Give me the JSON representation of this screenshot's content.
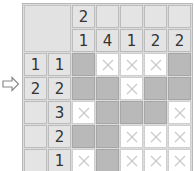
{
  "puzzle": {
    "type": "nonogram",
    "size": {
      "rows": 5,
      "cols": 5
    },
    "column_clues": [
      [
        "2",
        "1"
      ],
      [
        "4"
      ],
      [
        "1"
      ],
      [
        "2"
      ],
      [
        "2"
      ]
    ],
    "column_clue_rows": [
      [
        "2",
        "",
        "",
        "",
        ""
      ],
      [
        "1",
        "4",
        "1",
        "2",
        "2"
      ]
    ],
    "row_clues": [
      [
        "1",
        "1"
      ],
      [
        "2",
        "2"
      ],
      [
        "",
        "3"
      ],
      [
        "",
        "2"
      ],
      [
        "",
        "1"
      ]
    ],
    "grid": [
      [
        "filled",
        "crossed",
        "crossed",
        "crossed",
        "filled"
      ],
      [
        "filled",
        "filled",
        "crossed",
        "filled",
        "filled"
      ],
      [
        "crossed",
        "filled",
        "filled",
        "filled",
        "crossed"
      ],
      [
        "filled",
        "filled",
        "crossed",
        "crossed",
        "crossed"
      ],
      [
        "crossed",
        "filled",
        "crossed",
        "crossed",
        "crossed"
      ]
    ]
  },
  "arrow_icon": "right-arrow-icon",
  "colors": {
    "clue_bg": "#e4e4e4",
    "filled": "#b9b9b9",
    "crossed_bg": "#ffffff",
    "cross_mark": "#c8c8c8"
  }
}
